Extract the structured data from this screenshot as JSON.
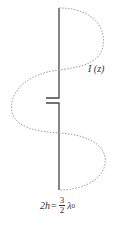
{
  "diagram": {
    "current_label": "I (z)",
    "equation": {
      "lhs": "2h",
      "equals": "=",
      "numerator": "3",
      "denominator": "2",
      "symbol": "λ",
      "subscript": "0"
    },
    "colors": {
      "conductor": "#444444",
      "current_curve": "#9a9a9a",
      "text": "#333333"
    }
  }
}
